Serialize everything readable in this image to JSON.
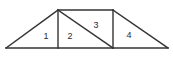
{
  "figure": {
    "name": "subdivided-trapezoid-truss",
    "background_color": "#ffffff",
    "line_color": "#333333",
    "label_color": "#2b2b2b",
    "canvas": {
      "width": 173,
      "height": 58
    },
    "vertices": {
      "base_left": [
        6,
        48
      ],
      "base_right": [
        168,
        48
      ],
      "apex_left": [
        58,
        10
      ],
      "apex_right": [
        113,
        10
      ],
      "mid_base_left": [
        58,
        48
      ],
      "mid_base_right": [
        113,
        48
      ]
    },
    "edges": [
      {
        "name": "baseline",
        "x1": 6,
        "y1": 48,
        "x2": 168,
        "y2": 48
      },
      {
        "name": "top-edge",
        "x1": 58,
        "y1": 10,
        "x2": 113,
        "y2": 10
      },
      {
        "name": "left-slope",
        "x1": 6,
        "y1": 48,
        "x2": 58,
        "y2": 10
      },
      {
        "name": "right-slope",
        "x1": 113,
        "y1": 10,
        "x2": 168,
        "y2": 48
      },
      {
        "name": "left-vertical",
        "x1": 58,
        "y1": 10,
        "x2": 58,
        "y2": 48
      },
      {
        "name": "right-vertical",
        "x1": 113,
        "y1": 10,
        "x2": 113,
        "y2": 48
      },
      {
        "name": "inner-diagonal",
        "x1": 58,
        "y1": 10,
        "x2": 113,
        "y2": 48
      }
    ],
    "regions": [
      {
        "label": "1",
        "x": 46,
        "y": 37
      },
      {
        "label": "2",
        "x": 70,
        "y": 37
      },
      {
        "label": "3",
        "x": 96,
        "y": 26
      },
      {
        "label": "4",
        "x": 129,
        "y": 36
      }
    ]
  }
}
